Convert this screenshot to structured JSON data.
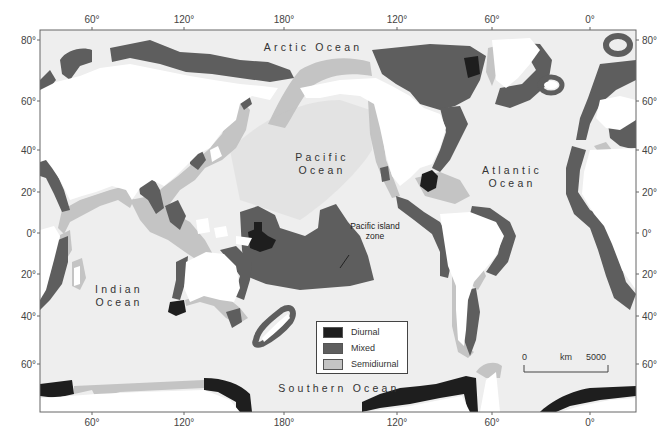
{
  "map": {
    "title": "",
    "colors": {
      "ocean": "#eeeeee",
      "land": "#ffffff",
      "diurnal": "#1e1e1e",
      "mixed": "#5e5e5e",
      "semidiurnal": "#c4c4c4",
      "frame": "#666666"
    },
    "axes": {
      "top_ticks": [
        "60°",
        "120°",
        "180°",
        "120°",
        "60°",
        "0°"
      ],
      "bottom_ticks": [
        "60°",
        "120°",
        "180°",
        "120°",
        "60°",
        "0°"
      ],
      "left_ticks": [
        "80°",
        "60°",
        "40°",
        "20°",
        "0°",
        "20°",
        "40°",
        "60°"
      ],
      "right_ticks": [
        "80°",
        "60°",
        "40°",
        "20°",
        "0°",
        "20°",
        "40°",
        "60°"
      ]
    },
    "ocean_labels": {
      "arctic": "Arctic Ocean",
      "pacific_line1": "Pacific",
      "pacific_line2": "Ocean",
      "atlantic_line1": "Atlantic",
      "atlantic_line2": "Ocean",
      "indian_line1": "Indian",
      "indian_line2": "Ocean",
      "southern": "Southern Ocean"
    },
    "annotations": {
      "pacific_island_line1": "Pacific island",
      "pacific_island_line2": "zone"
    },
    "legend": {
      "items": [
        {
          "label": "Diurnal",
          "color": "#1e1e1e"
        },
        {
          "label": "Mixed",
          "color": "#5e5e5e"
        },
        {
          "label": "Semidiurnal",
          "color": "#c4c4c4"
        }
      ]
    },
    "scale_bar": {
      "start": "0",
      "unit": "km",
      "end": "5000"
    }
  }
}
